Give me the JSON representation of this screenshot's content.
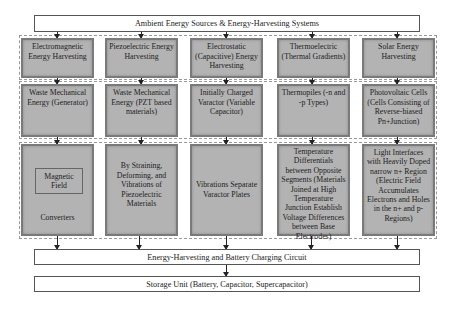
{
  "title": "Ambient Energy Sources & Energy-Harvesting Systems",
  "columns": [
    {
      "type": "Electromagnetic Energy Harvesting",
      "source": "Waste Mechanical Energy (Generator)",
      "mechanism_inner": "Magnetic Field",
      "mechanism": "Converters"
    },
    {
      "type": "Piezoelectric Energy Harvesting",
      "source": "Waste Mechanical Energy (PZT based materials)",
      "mechanism": "By Straining, Deforming, and Vibrations of Piezoelectric Materials"
    },
    {
      "type": "Electrostatic (Capacitive) Energy Harvesting",
      "source": "Initially Charged Varactor (Variable Capacitor)",
      "mechanism": "Vibrations Separate Varactor Plates"
    },
    {
      "type": "Thermoelectric (Thermal Gradients)",
      "source": "Thermopiles (-n and -p Types)",
      "mechanism": "Temperature Differentials between Opposite Segments (Materials Joined at High Temperature Junction Establish Voltage Differences between Base Electrodes)"
    },
    {
      "type": "Solar Energy Harvesting",
      "source": "Photovoltaic Cells (Cells Consisting of Reverse-biased Pn+Junction)",
      "mechanism": "Light Interfaces with Heavily Doped narrow n+ Region (Electric Field Accumulates Electrons and Holes in the n+ and p- Regions)"
    }
  ],
  "circuit": "Energy-Harvesting and Battery Charging Circuit",
  "storage": "Storage Unit (Battery, Capacitor, Supercapacitor)"
}
